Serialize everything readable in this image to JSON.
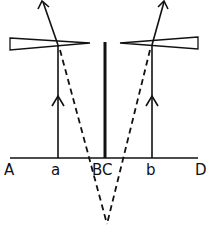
{
  "diagram": {
    "type": "optical ray diagram with two thin prisms",
    "colors": {
      "stroke": "#111111",
      "background": "#ffffff"
    },
    "baseline": {
      "x1": 10,
      "x2": 198,
      "y": 158
    },
    "labels": [
      {
        "id": "A",
        "text": "A",
        "x": 4,
        "y": 175
      },
      {
        "id": "a",
        "text": "a",
        "x": 51,
        "y": 175
      },
      {
        "id": "BC",
        "text": "BC",
        "x": 92,
        "y": 175
      },
      {
        "id": "b",
        "text": "b",
        "x": 146,
        "y": 175
      },
      {
        "id": "D",
        "text": "D",
        "x": 195,
        "y": 175
      }
    ],
    "left_prism": {
      "orientation": "thick end left",
      "apex_x": 90,
      "base_x": 10
    },
    "right_prism": {
      "orientation": "thick end right",
      "apex_x": 120,
      "base_x": 198
    },
    "center_barrier": {
      "x": 105,
      "y1": 42,
      "y2": 158
    },
    "rays": [
      {
        "name": "left-ray",
        "from": "a",
        "direction": "up",
        "deviated": true
      },
      {
        "name": "right-ray",
        "from": "b",
        "direction": "up",
        "deviated": true
      }
    ],
    "virtual_rays": {
      "style": "dashed",
      "converge_point": [
        107,
        226
      ]
    }
  }
}
